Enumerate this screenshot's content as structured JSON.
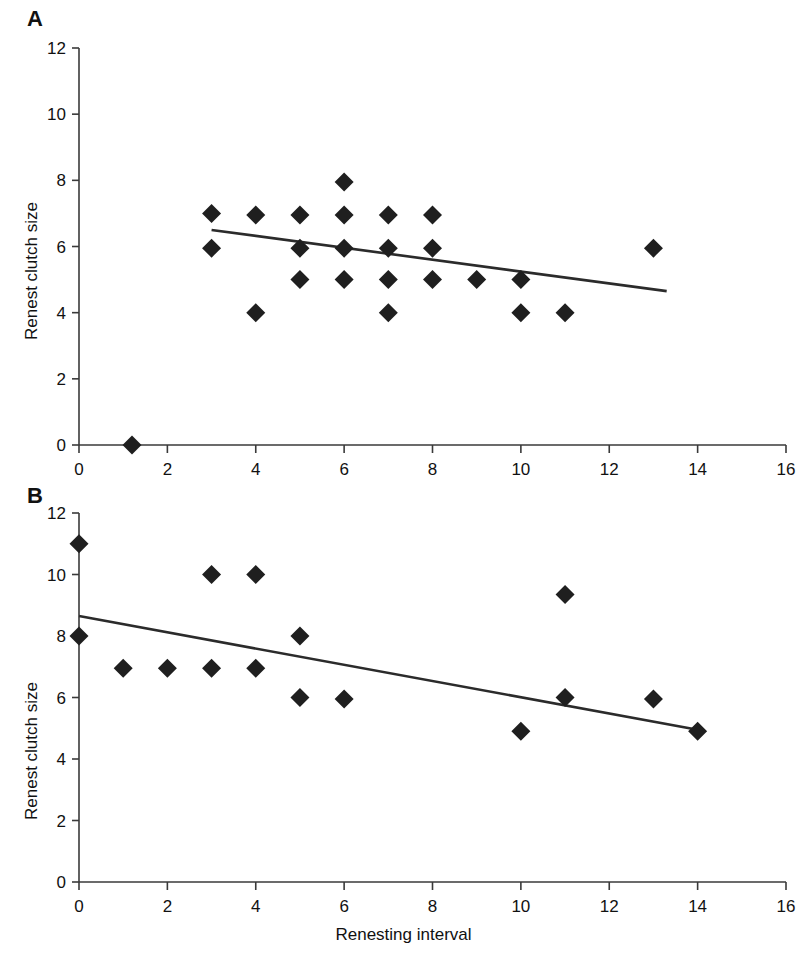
{
  "figure": {
    "panel_a_label": "A",
    "panel_b_label": "B",
    "xlabel": "Renesting interval",
    "ylabel": "Renest clutch size",
    "marker_color": "#1f1f1f",
    "line_color": "#2b2b2b",
    "axis_color": "#3a3a3a",
    "background": "#ffffff"
  },
  "chart_data": [
    {
      "type": "scatter",
      "panel": "A",
      "title": "",
      "xlabel": "",
      "ylabel": "Renest clutch size",
      "xlim": [
        0,
        16
      ],
      "ylim": [
        0,
        12
      ],
      "xticks": [
        0,
        2,
        4,
        6,
        8,
        10,
        12,
        14,
        16
      ],
      "yticks": [
        0,
        2,
        4,
        6,
        8,
        10,
        12
      ],
      "xtick_labels": [
        "0",
        "2",
        "4",
        "6",
        "8",
        "10",
        "12",
        "14",
        "16"
      ],
      "ytick_labels": [
        "0",
        "2",
        "4",
        "6",
        "8",
        "10",
        "12"
      ],
      "grid": false,
      "legend": false,
      "marker": "diamond",
      "points": [
        [
          1.2,
          0
        ],
        [
          3,
          7.0
        ],
        [
          3,
          5.95
        ],
        [
          4,
          6.95
        ],
        [
          4,
          4.0
        ],
        [
          5,
          6.95
        ],
        [
          5,
          5.95
        ],
        [
          5,
          5.0
        ],
        [
          6,
          7.95
        ],
        [
          6,
          6.95
        ],
        [
          6,
          5.95
        ],
        [
          6,
          5.0
        ],
        [
          7,
          6.95
        ],
        [
          7,
          5.95
        ],
        [
          7,
          5.0
        ],
        [
          7,
          4.0
        ],
        [
          8,
          6.95
        ],
        [
          8,
          5.95
        ],
        [
          8,
          5.0
        ],
        [
          9,
          5.0
        ],
        [
          10,
          5.0
        ],
        [
          10,
          4.0
        ],
        [
          11,
          4.0
        ],
        [
          13,
          5.95
        ]
      ],
      "fit_line": {
        "x": [
          3.0,
          13.3
        ],
        "y": [
          6.5,
          4.65
        ]
      }
    },
    {
      "type": "scatter",
      "panel": "B",
      "title": "",
      "xlabel": "Renesting interval",
      "ylabel": "Renest clutch size",
      "xlim": [
        0,
        16
      ],
      "ylim": [
        0,
        12
      ],
      "xticks": [
        0,
        2,
        4,
        6,
        8,
        10,
        12,
        14,
        16
      ],
      "yticks": [
        0,
        2,
        4,
        6,
        8,
        10,
        12
      ],
      "xtick_labels": [
        "0",
        "2",
        "4",
        "6",
        "8",
        "10",
        "12",
        "14",
        "16"
      ],
      "ytick_labels": [
        "0",
        "2",
        "4",
        "6",
        "8",
        "10",
        "12"
      ],
      "grid": false,
      "legend": false,
      "marker": "diamond",
      "points": [
        [
          0,
          11.0
        ],
        [
          0,
          8.0
        ],
        [
          1,
          6.95
        ],
        [
          2,
          6.95
        ],
        [
          3,
          10.0
        ],
        [
          3,
          6.95
        ],
        [
          4,
          10.0
        ],
        [
          4,
          6.95
        ],
        [
          5,
          8.0
        ],
        [
          5,
          6.0
        ],
        [
          6,
          5.95
        ],
        [
          10,
          4.9
        ],
        [
          11,
          9.35
        ],
        [
          11,
          6.0
        ],
        [
          13,
          5.95
        ],
        [
          14,
          4.9
        ]
      ],
      "fit_line": {
        "x": [
          0.0,
          14.0
        ],
        "y": [
          8.65,
          4.95
        ]
      }
    }
  ]
}
